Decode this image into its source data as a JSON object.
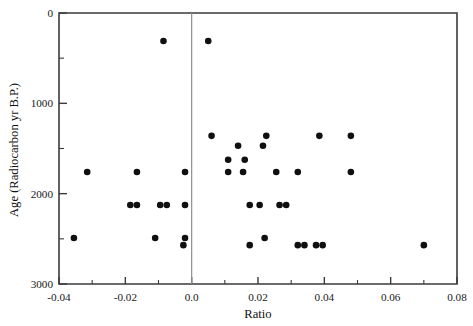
{
  "chart_data": {
    "type": "scatter",
    "title": "",
    "xlabel": "Ratio",
    "ylabel": "Age (Radiocarbon yr B.P.)",
    "xlim": [
      -0.04,
      0.08
    ],
    "ylim": [
      0,
      3000
    ],
    "y_axis_inverted": true,
    "grid": false,
    "legend": "none",
    "xticks": [
      -0.04,
      -0.02,
      0.0,
      0.02,
      0.04,
      0.06,
      0.08
    ],
    "xtick_labels": [
      "-0.04",
      "-0.02",
      "0.0",
      "0.02",
      "0.04",
      "0.06",
      "0.08"
    ],
    "x_minor_tick_interval": 0.01,
    "yticks": [
      0,
      1000,
      2000,
      3000
    ],
    "ytick_labels": [
      "0",
      "1000",
      "2000",
      "3000"
    ],
    "y_minor_tick_interval": 500,
    "annotations": [
      {
        "name": "zero-reference-line",
        "type": "vline",
        "x": 0.0
      }
    ],
    "marker": {
      "shape": "circle",
      "color": "#101010",
      "size": 3.3
    },
    "points": [
      {
        "x": -0.0085,
        "y": 310
      },
      {
        "x": 0.005,
        "y": 310
      },
      {
        "x": 0.006,
        "y": 1360
      },
      {
        "x": 0.0225,
        "y": 1360
      },
      {
        "x": 0.0385,
        "y": 1360
      },
      {
        "x": 0.048,
        "y": 1360
      },
      {
        "x": 0.014,
        "y": 1470
      },
      {
        "x": 0.0215,
        "y": 1470
      },
      {
        "x": 0.011,
        "y": 1625
      },
      {
        "x": 0.016,
        "y": 1625
      },
      {
        "x": -0.0315,
        "y": 1760
      },
      {
        "x": -0.0165,
        "y": 1760
      },
      {
        "x": -0.002,
        "y": 1760
      },
      {
        "x": 0.011,
        "y": 1760
      },
      {
        "x": 0.0155,
        "y": 1760
      },
      {
        "x": 0.0255,
        "y": 1760
      },
      {
        "x": 0.032,
        "y": 1760
      },
      {
        "x": 0.048,
        "y": 1760
      },
      {
        "x": -0.0185,
        "y": 2125
      },
      {
        "x": -0.0165,
        "y": 2125
      },
      {
        "x": -0.0095,
        "y": 2125
      },
      {
        "x": -0.0075,
        "y": 2125
      },
      {
        "x": -0.002,
        "y": 2125
      },
      {
        "x": 0.0175,
        "y": 2125
      },
      {
        "x": 0.0205,
        "y": 2125
      },
      {
        "x": 0.0265,
        "y": 2125
      },
      {
        "x": 0.0285,
        "y": 2125
      },
      {
        "x": -0.0355,
        "y": 2490
      },
      {
        "x": -0.011,
        "y": 2490
      },
      {
        "x": -0.002,
        "y": 2490
      },
      {
        "x": 0.022,
        "y": 2490
      },
      {
        "x": -0.0025,
        "y": 2570
      },
      {
        "x": 0.0175,
        "y": 2570
      },
      {
        "x": 0.032,
        "y": 2570
      },
      {
        "x": 0.034,
        "y": 2570
      },
      {
        "x": 0.0375,
        "y": 2570
      },
      {
        "x": 0.0395,
        "y": 2570
      },
      {
        "x": 0.07,
        "y": 2570
      }
    ]
  }
}
